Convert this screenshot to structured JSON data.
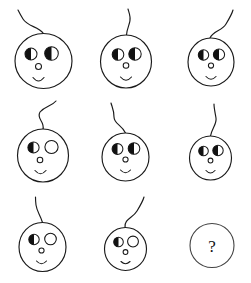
{
  "puzzle": {
    "title": "Matrix Reasoning Puzzle",
    "type": "3x3-visual-analogy-matrix",
    "background_color": "#ffffff",
    "ink_color": "#1a1a1a",
    "fill_color": "#111111",
    "width": 251,
    "height": 283,
    "rows": 3,
    "columns": 3,
    "missing_cell_index": 8,
    "answer_placeholder": "?"
  },
  "cells": [
    {
      "index": 0,
      "row": 1,
      "column": 1,
      "name": "cell-r1c1",
      "kind": "creature",
      "head": {
        "cx": 43.5,
        "cy": 61.0,
        "rx": 28.5,
        "ry": 27.5
      },
      "stalk": {
        "name": "stalk-hook-left",
        "path": "M 43.5 33.5 C 38 26 28 27 23 19 C 20 14 19 12 18 10"
      },
      "eyes": {
        "left": {
          "cx": 31.0,
          "cy": 54.0,
          "r": 6.0,
          "fill": "left-half"
        },
        "right": {
          "cx": 51.5,
          "cy": 53.5,
          "r": 6.8,
          "fill": "left-half"
        }
      },
      "nose": {
        "cx": 38.5,
        "cy": 66.5,
        "r": 3.0
      },
      "mouth": {
        "path": "M 33.0 77.5 Q 38.5 84.5 44.0 77.5"
      }
    },
    {
      "index": 1,
      "row": 1,
      "column": 2,
      "name": "cell-r1c2",
      "kind": "creature",
      "head": {
        "cx": 126.0,
        "cy": 61.5,
        "rx": 25.5,
        "ry": 26.5
      },
      "stalk": {
        "name": "stalk-wavy-up",
        "path": "M 126.5 35.0 C 127 27 131 23 130 17 C 129.5 13 128.5 11 128.0 9"
      },
      "eyes": {
        "left": {
          "cx": 118.0,
          "cy": 54.5,
          "r": 5.8,
          "fill": "left-half"
        },
        "right": {
          "cx": 135.0,
          "cy": 54.0,
          "r": 6.2,
          "fill": "left-half"
        }
      },
      "nose": {
        "cx": 126.0,
        "cy": 65.5,
        "r": 2.8
      },
      "mouth": {
        "path": "M 120.5 77.0 Q 126.0 83.5 131.5 77.0"
      }
    },
    {
      "index": 2,
      "row": 1,
      "column": 3,
      "name": "cell-r1c3",
      "kind": "creature",
      "head": {
        "cx": 211.0,
        "cy": 62.0,
        "rx": 23.0,
        "ry": 24.0
      },
      "stalk": {
        "name": "stalk-hook-right",
        "path": "M 210.0 38.0 C 213 31 222 31 226 24 C 229 19 232 14 233 10"
      },
      "eyes": {
        "left": {
          "cx": 203.5,
          "cy": 55.0,
          "r": 5.2,
          "fill": "left-half"
        },
        "right": {
          "cx": 219.0,
          "cy": 54.5,
          "r": 5.6,
          "fill": "left-half"
        }
      },
      "nose": {
        "cx": 211.0,
        "cy": 65.5,
        "r": 2.6
      },
      "mouth": {
        "path": "M 206.0 76.5 Q 211.0 82.0 216.0 76.5"
      }
    },
    {
      "index": 3,
      "row": 2,
      "column": 1,
      "name": "cell-r2c1",
      "kind": "creature",
      "head": {
        "cx": 43.0,
        "cy": 155.5,
        "rx": 25.5,
        "ry": 26.5
      },
      "stalk": {
        "name": "stalk-s-right",
        "path": "M 43.0 129.5 C 45 121 36 119 40 112 C 45 106 52 106 56 101"
      },
      "eyes": {
        "left": {
          "cx": 33.5,
          "cy": 147.5,
          "r": 5.6,
          "fill": "left-half"
        },
        "right": {
          "cx": 51.5,
          "cy": 147.0,
          "r": 6.6,
          "fill": "full"
        }
      },
      "nose": {
        "cx": 40.0,
        "cy": 160.0,
        "r": 2.8
      },
      "mouth": {
        "path": "M 35.0 170.5 Q 40.5 177.0 46.0 170.5"
      }
    },
    {
      "index": 4,
      "row": 2,
      "column": 2,
      "name": "cell-r2c2",
      "kind": "creature",
      "head": {
        "cx": 125.5,
        "cy": 157.0,
        "rx": 23.5,
        "ry": 24.0
      },
      "stalk": {
        "name": "stalk-s-left",
        "path": "M 125.5 133.0 C 122 125 114 124 114 117 C 114 110 112 107 111 103"
      },
      "eyes": {
        "left": {
          "cx": 117.5,
          "cy": 149.0,
          "r": 5.4,
          "fill": "left-half"
        },
        "right": {
          "cx": 134.0,
          "cy": 148.5,
          "r": 5.8,
          "fill": "left-half"
        }
      },
      "nose": {
        "cx": 125.5,
        "cy": 159.5,
        "r": 2.6
      },
      "mouth": {
        "path": "M 120.5 170.0 Q 125.5 175.5 130.5 170.0"
      }
    },
    {
      "index": 5,
      "row": 2,
      "column": 3,
      "name": "cell-r2c3",
      "kind": "creature",
      "head": {
        "cx": 210.5,
        "cy": 158.0,
        "rx": 21.0,
        "ry": 22.0
      },
      "stalk": {
        "name": "stalk-near-straight",
        "path": "M 210.5 136.0 C 212 128 217 124 216 118 C 215 112 214 108 214 104"
      },
      "eyes": {
        "left": {
          "cx": 203.5,
          "cy": 151.0,
          "r": 4.8,
          "fill": "left-half"
        },
        "right": {
          "cx": 218.0,
          "cy": 150.5,
          "r": 5.2,
          "fill": "left-half"
        }
      },
      "nose": {
        "cx": 210.5,
        "cy": 160.5,
        "r": 2.4
      },
      "mouth": {
        "path": "M 206.0 170.5 Q 210.5 175.5 215.0 170.5"
      }
    },
    {
      "index": 6,
      "row": 3,
      "column": 1,
      "name": "cell-r3c1",
      "kind": "creature",
      "head": {
        "cx": 42.5,
        "cy": 247.0,
        "rx": 23.5,
        "ry": 24.5
      },
      "stalk": {
        "name": "stalk-straight-wavy",
        "path": "M 42.5 222.5 C 40 214 37 212 36 205 C 35.5 201 35.5 199 35.5 197"
      },
      "eyes": {
        "left": {
          "cx": 34.0,
          "cy": 239.5,
          "r": 5.2,
          "fill": "left-half"
        },
        "right": {
          "cx": 50.5,
          "cy": 239.0,
          "r": 5.8,
          "fill": "full"
        }
      },
      "nose": {
        "cx": 41.5,
        "cy": 250.5,
        "r": 2.6
      },
      "mouth": {
        "path": "M 36.5 261.0 Q 41.5 266.5 46.5 261.0"
      }
    },
    {
      "index": 7,
      "row": 3,
      "column": 2,
      "name": "cell-r3c2",
      "kind": "creature",
      "head": {
        "cx": 125.5,
        "cy": 249.0,
        "rx": 21.0,
        "ry": 21.5
      },
      "stalk": {
        "name": "stalk-hook-right-tall",
        "path": "M 125.0 227.5 C 124 219 133 218 137 211 C 140 206 143 201 144 197"
      },
      "eyes": {
        "left": {
          "cx": 118.5,
          "cy": 242.0,
          "r": 4.8,
          "fill": "left-half"
        },
        "right": {
          "cx": 133.0,
          "cy": 241.5,
          "r": 5.4,
          "fill": "full"
        }
      },
      "nose": {
        "cx": 125.5,
        "cy": 252.0,
        "r": 2.4
      },
      "mouth": {
        "path": "M 121.0 261.5 Q 125.5 266.0 130.0 261.5"
      }
    },
    {
      "index": 8,
      "row": 3,
      "column": 3,
      "name": "cell-r3c3-answer",
      "kind": "answer-placeholder",
      "head": {
        "cx": 212.0,
        "cy": 245.5,
        "rx": 22.0,
        "ry": 22.0
      },
      "label": "?"
    }
  ]
}
